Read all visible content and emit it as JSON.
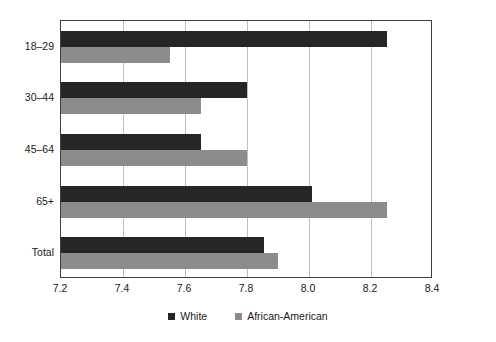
{
  "chart_data": {
    "type": "bar",
    "orientation": "horizontal",
    "title": "",
    "xlabel": "",
    "ylabel": "",
    "xlim": [
      7.2,
      8.4
    ],
    "xticks": [
      "7.2",
      "7.4",
      "7.6",
      "7.8",
      "8.0",
      "8.2",
      "8.4"
    ],
    "xtick_values": [
      7.2,
      7.4,
      7.6,
      7.8,
      8.0,
      8.2,
      8.4
    ],
    "grid": true,
    "legend_position": "bottom-center",
    "categories": [
      "18–29",
      "30–44",
      "45–64",
      "65+",
      "Total"
    ],
    "series": [
      {
        "name": "White",
        "color": "#262626",
        "values": [
          8.25,
          7.8,
          7.65,
          8.01,
          7.855
        ]
      },
      {
        "name": "African-American",
        "color": "#8c8c8c",
        "values": [
          7.55,
          7.65,
          7.8,
          8.25,
          7.9
        ]
      }
    ]
  },
  "axis": {
    "ytick_labels": [
      "18–29",
      "30–44",
      "45–64",
      "65+",
      "Total"
    ],
    "xtick_labels": [
      "7.2",
      "7.4",
      "7.6",
      "7.8",
      "8.0",
      "8.2",
      "8.4"
    ]
  },
  "legend": {
    "items": [
      {
        "label": "White",
        "color": "#262626"
      },
      {
        "label": "African-American",
        "color": "#8c8c8c"
      }
    ]
  },
  "style": {
    "series_white_color": "#262626",
    "series_aa_color": "#8c8c8c",
    "gridline_color": "#bfbfbf",
    "frame_color": "#3f3f3f",
    "background_color": "#ffffff"
  }
}
